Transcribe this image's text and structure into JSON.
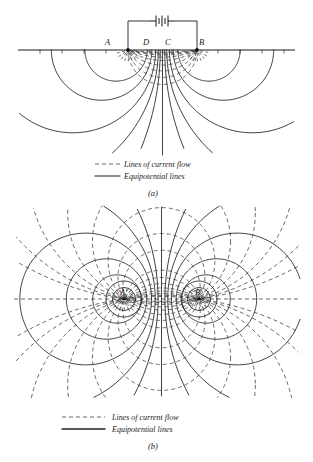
{
  "figure": {
    "panels": [
      {
        "id": "a",
        "caption": "(a)",
        "electrode_labels": [
          "A",
          "D",
          "C",
          "B"
        ],
        "legend": {
          "current_flow": "Lines of current flow",
          "equipotential": "Equipotential lines"
        },
        "circuit": {
          "source": "battery"
        }
      },
      {
        "id": "b",
        "caption": "(b)",
        "electrode_labels": [
          "A",
          "B"
        ],
        "legend": {
          "current_flow": "Lines of current flow",
          "equipotential": "Equipotential lines"
        }
      }
    ]
  },
  "chart_data": {
    "type": "diagram",
    "title": "",
    "panels": [
      {
        "label": "(a)",
        "description": "Half-space (below ground surface) field pattern for current electrodes A and B energized by a battery; potential electrodes D and C between them.",
        "geometry": {
          "surface_line_y": 50,
          "surface_line_x_range": [
            18,
            295
          ],
          "electrodes": [
            {
              "name": "A",
              "x": 128,
              "y": 50
            },
            {
              "name": "D",
              "x": 148,
              "y": 50
            },
            {
              "name": "C",
              "x": 170,
              "y": 50
            },
            {
              "name": "B",
              "x": 197,
              "y": 50
            }
          ],
          "battery_y": 21,
          "battery_x": 162,
          "equipotential_count_per_electrode": 8,
          "current_line_count": 9
        }
      },
      {
        "label": "(b)",
        "description": "Full-plane field pattern about the same two electrodes, showing closed equipotential circles and current flow arcs.",
        "geometry": {
          "axis_y": 299,
          "axis_x_range": [
            14,
            300
          ],
          "electrodes": [
            {
              "name": "A",
              "x": 124,
              "y": 299
            },
            {
              "name": "B",
              "x": 199,
              "y": 299
            }
          ],
          "equipotential_count_per_electrode": 5,
          "current_line_count": 12
        }
      }
    ],
    "legend": [
      {
        "style": "dashed",
        "label": "Lines of current flow"
      },
      {
        "style": "solid",
        "label": "Equipotential lines"
      }
    ]
  }
}
